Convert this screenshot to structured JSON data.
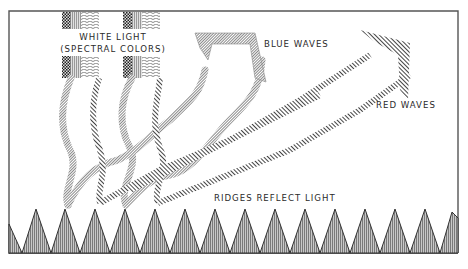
{
  "labels": {
    "white_light_line1": "WHITE LIGHT",
    "white_light_line2": "(SPECTRAL COLORS)",
    "blue_waves": "BLUE WAVES",
    "red_waves": "RED WAVES",
    "ridges": "RIDGES REFLECT LIGHT"
  },
  "colors": {
    "frame": "#555555",
    "ink": "#2a2a2a",
    "blue_wave_fill": "#9a9a9a",
    "red_wave_stroke": "#555555",
    "ridge_fill": "#a8a8a8",
    "background": "#ffffff"
  },
  "ridges": {
    "count": 15,
    "peak_y": 209,
    "base_y": 253,
    "spacing": 30
  }
}
